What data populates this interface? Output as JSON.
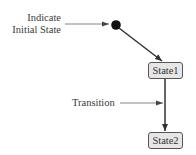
{
  "diagram": {
    "type": "uml-state-machine",
    "annotations": {
      "initial_state": {
        "line1": "Indicate",
        "line2": "Initial State"
      },
      "transition": "Transition"
    },
    "states": [
      {
        "id": "state1",
        "label": "State1"
      },
      {
        "id": "state2",
        "label": "State2"
      }
    ],
    "edges": [
      {
        "from": "initial",
        "to": "state1"
      },
      {
        "from": "state1",
        "to": "state2"
      }
    ],
    "colors": {
      "line": "#333333",
      "annotation_line": "#666666",
      "state_fill": "#e6e6e6",
      "state_border": "#555555",
      "initial_node": "#111111"
    }
  }
}
